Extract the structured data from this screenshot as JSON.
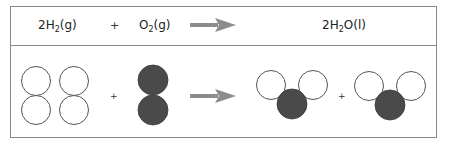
{
  "equation": {
    "reactant1": {
      "coef": "2",
      "symbol": "H",
      "sub": "2",
      "state": "(g)"
    },
    "operator1": "+",
    "reactant2": {
      "coef": "",
      "symbol": "O",
      "sub": "2",
      "state": "(g)"
    },
    "arrow": "yields-arrow",
    "product": {
      "coef": "2",
      "symbol": "H",
      "sub": "2",
      "tail": "O(l)"
    }
  },
  "models": {
    "operator_left": "+",
    "operator_right": "+",
    "colors": {
      "hydrogen_fill": "#ffffff",
      "hydrogen_stroke": "#555555",
      "oxygen_fill": "#4a4a4a",
      "arrow": "#8c8c8c",
      "border": "#8a8a8a"
    }
  }
}
